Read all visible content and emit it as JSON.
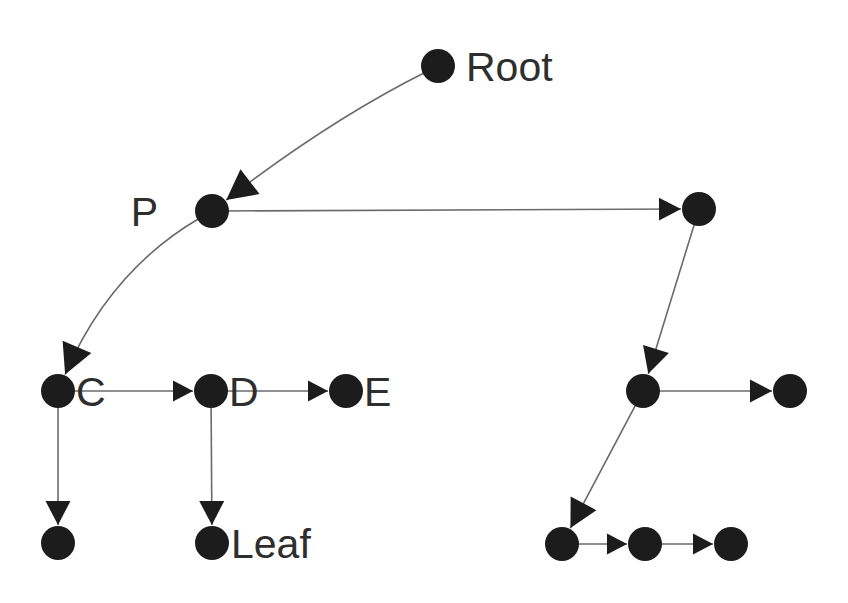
{
  "diagram": {
    "background_color": "#ffffff",
    "node_color": "#1c1c1c",
    "edge_color": "#6a6a6a",
    "arrow_color": "#1c1c1c",
    "label_color": "#2e2e2e",
    "node_radius": 17,
    "labels": {
      "root": "Root",
      "parent": "P",
      "child_c": "C",
      "child_d": "D",
      "child_e": "E",
      "leaf": "Leaf"
    },
    "nodes": [
      {
        "id": "root",
        "label": "Root",
        "x": 438,
        "y": 66,
        "label_side": "right",
        "label_x": 466,
        "label_y": 81
      },
      {
        "id": "p",
        "label": "P",
        "x": 212,
        "y": 211,
        "label_side": "left",
        "label_x": 158,
        "label_y": 226
      },
      {
        "id": "r1",
        "label": "",
        "x": 699,
        "y": 209,
        "label_side": "none",
        "label_x": 0,
        "label_y": 0
      },
      {
        "id": "c",
        "label": "C",
        "x": 58,
        "y": 391,
        "label_side": "right",
        "label_x": 76,
        "label_y": 406
      },
      {
        "id": "d",
        "label": "D",
        "x": 211,
        "y": 391,
        "label_side": "right",
        "label_x": 229,
        "label_y": 406
      },
      {
        "id": "e",
        "label": "E",
        "x": 346,
        "y": 391,
        "label_side": "right",
        "label_x": 364,
        "label_y": 406
      },
      {
        "id": "r2",
        "label": "",
        "x": 643,
        "y": 391,
        "label_side": "none",
        "label_x": 0,
        "label_y": 0
      },
      {
        "id": "r3",
        "label": "",
        "x": 790,
        "y": 391,
        "label_side": "none",
        "label_x": 0,
        "label_y": 0
      },
      {
        "id": "cl",
        "label": "",
        "x": 58,
        "y": 543,
        "label_side": "none",
        "label_x": 0,
        "label_y": 0
      },
      {
        "id": "leaf",
        "label": "Leaf",
        "x": 212,
        "y": 543,
        "label_side": "right",
        "label_x": 231,
        "label_y": 558
      },
      {
        "id": "b1",
        "label": "",
        "x": 562,
        "y": 544,
        "label_side": "none",
        "label_x": 0,
        "label_y": 0
      },
      {
        "id": "b2",
        "label": "",
        "x": 645,
        "y": 544,
        "label_side": "none",
        "label_x": 0,
        "label_y": 0
      },
      {
        "id": "b3",
        "label": "",
        "x": 731,
        "y": 544,
        "label_side": "none",
        "label_x": 0,
        "label_y": 0
      }
    ],
    "edges": [
      {
        "id": "root-p",
        "from": "root",
        "to": "p",
        "type": "curve",
        "curve_x": 330,
        "curve_y": 120,
        "arrow_size": 30
      },
      {
        "id": "p-r1",
        "from": "p",
        "to": "r1",
        "type": "line",
        "arrow_size": 22
      },
      {
        "id": "p-c",
        "from": "p",
        "to": "c",
        "type": "curve",
        "curve_x": 110,
        "curve_y": 270,
        "arrow_size": 30
      },
      {
        "id": "c-d",
        "from": "c",
        "to": "d",
        "type": "line",
        "arrow_size": 20
      },
      {
        "id": "d-e",
        "from": "d",
        "to": "e",
        "type": "line",
        "arrow_size": 20
      },
      {
        "id": "c-cl",
        "from": "c",
        "to": "cl",
        "type": "line",
        "arrow_size": 24
      },
      {
        "id": "d-leaf",
        "from": "d",
        "to": "leaf",
        "type": "line",
        "arrow_size": 24
      },
      {
        "id": "r1-r2",
        "from": "r1",
        "to": "r2",
        "type": "line",
        "arrow_size": 26
      },
      {
        "id": "r2-r3",
        "from": "r2",
        "to": "r3",
        "type": "line",
        "arrow_size": 22
      },
      {
        "id": "r2-b1",
        "from": "r2",
        "to": "b1",
        "type": "line",
        "arrow_size": 28
      },
      {
        "id": "b1-b2",
        "from": "b1",
        "to": "b2",
        "type": "line",
        "arrow_size": 20
      },
      {
        "id": "b2-b3",
        "from": "b2",
        "to": "b3",
        "type": "line",
        "arrow_size": 20
      }
    ]
  }
}
